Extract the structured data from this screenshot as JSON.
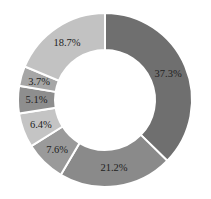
{
  "chart_data": {
    "type": "pie",
    "variant": "donut",
    "title": "",
    "start_angle_deg": 0,
    "direction": "clockwise",
    "slices": [
      {
        "label": "37.3%",
        "value": 37.3,
        "color": "#6f6f6f"
      },
      {
        "label": "21.2%",
        "value": 21.2,
        "color": "#8a8a8a"
      },
      {
        "label": "7.6%",
        "value": 7.6,
        "color": "#9a9a9a"
      },
      {
        "label": "6.4%",
        "value": 6.4,
        "color": "#c4c4c4"
      },
      {
        "label": "5.1%",
        "value": 5.1,
        "color": "#8e8e8e"
      },
      {
        "label": "3.7%",
        "value": 3.7,
        "color": "#a6a6a6"
      },
      {
        "label": "18.7%",
        "value": 18.7,
        "color": "#c2c2c2"
      }
    ],
    "legend": "none",
    "center": [
      105,
      100
    ],
    "outer_radius": 87,
    "inner_radius": 50
  }
}
